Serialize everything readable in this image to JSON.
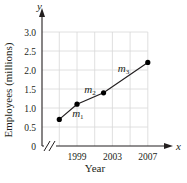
{
  "chart_data": {
    "type": "line",
    "title": "",
    "xlabel": "Year",
    "ylabel": "Employees (millions)",
    "x_axis_var": "x",
    "y_axis_var": "y",
    "x": [
      1997,
      1999,
      2002,
      2007
    ],
    "series": [
      {
        "name": "Employees",
        "values": [
          0.7,
          1.1,
          1.4,
          2.2
        ]
      }
    ],
    "segment_labels": [
      {
        "label": "m",
        "sub": "1",
        "between": [
          1997,
          1999
        ]
      },
      {
        "label": "m",
        "sub": "2",
        "between": [
          1999,
          2002
        ]
      },
      {
        "label": "m",
        "sub": "3",
        "between": [
          2002,
          2007
        ]
      }
    ],
    "x_ticks": [
      "1999",
      "2003",
      "2007"
    ],
    "y_ticks": [
      "0",
      "0.5",
      "1.0",
      "1.5",
      "2.0",
      "2.5",
      "3.0"
    ],
    "xlim": [
      1995,
      2008
    ],
    "ylim": [
      0,
      3.2
    ],
    "grid": true,
    "x_axis_break": true,
    "legend": null,
    "colors": {
      "line": "#231f20",
      "grid": "#d8d8d8",
      "points": "#000000"
    }
  }
}
